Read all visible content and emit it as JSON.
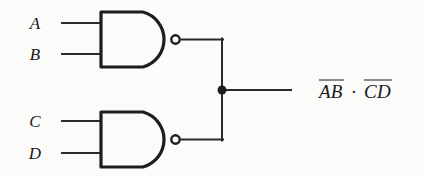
{
  "diagram": {
    "background_color": "#fbfbf9",
    "ink_color": "#18181a"
  },
  "inputs": [
    {
      "label": "A",
      "gate": "nand-top",
      "pin": 1,
      "x": 35,
      "y": 23
    },
    {
      "label": "B",
      "gate": "nand-top",
      "pin": 2,
      "x": 35,
      "y": 54
    },
    {
      "label": "C",
      "gate": "nand-bottom",
      "pin": 1,
      "x": 35,
      "y": 121
    },
    {
      "label": "D",
      "gate": "nand-bottom",
      "pin": 2,
      "x": 35,
      "y": 153
    }
  ],
  "gates": [
    {
      "name": "nand-top",
      "type": "NAND",
      "inputs": [
        "A",
        "B"
      ],
      "body": {
        "left": 100,
        "top": 11,
        "right": 178,
        "bottom": 68
      },
      "bubble": {
        "cx": 176,
        "cy": 39.5,
        "r": 4.2
      }
    },
    {
      "name": "nand-bottom",
      "type": "NAND",
      "inputs": [
        "C",
        "D"
      ],
      "body": {
        "left": 100,
        "top": 111,
        "right": 178,
        "bottom": 168
      },
      "bubble": {
        "cx": 176,
        "cy": 139.5,
        "r": 4.2
      }
    }
  ],
  "junction": {
    "cx": 222,
    "cy": 90,
    "r": 4.5
  },
  "output": {
    "wire": {
      "x1": 222,
      "y1": 90,
      "x2": 290,
      "y2": 90
    },
    "label": {
      "x": 355,
      "y": 90,
      "term_1": "AB",
      "operator": "·",
      "term_2": "CD",
      "plain_text": "AB̅ · CD̅"
    }
  }
}
